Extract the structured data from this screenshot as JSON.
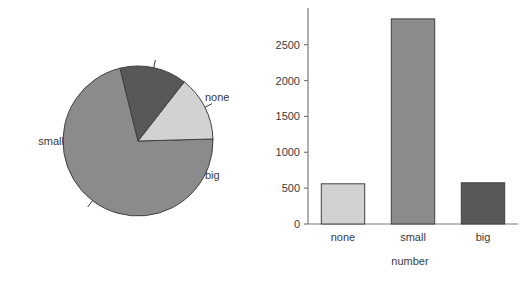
{
  "figure": {
    "width": 521,
    "height": 286,
    "background": "#ffffff"
  },
  "colors": {
    "none": "#d2d2d2",
    "small": "#8b8b8b",
    "big": "#585858",
    "outline": "#404040",
    "axis": "#7a7a7a",
    "text": "#3a3a3a"
  },
  "chart_data": [
    {
      "type": "pie",
      "title": "",
      "labels": [
        "none",
        "small",
        "big"
      ],
      "values": [
        560,
        2860,
        575
      ],
      "percentages": [
        14,
        71.5,
        14.4
      ],
      "colors": [
        "#d2d2d2",
        "#8b8b8b",
        "#585858"
      ],
      "legend": "none",
      "label_positions": [
        "right-upper",
        "left",
        "right-lower"
      ],
      "start_angle_deg": 52,
      "direction": "clockwise",
      "labels_text": {
        "none": "none",
        "small": "small",
        "big": "big"
      }
    },
    {
      "type": "bar",
      "title": "",
      "categories": [
        "none",
        "small",
        "big"
      ],
      "values": [
        560,
        2860,
        575
      ],
      "colors": [
        "#d2d2d2",
        "#8b8b8b",
        "#585858"
      ],
      "xlabel": "number",
      "ylabel": "",
      "ylim": [
        0,
        2900
      ],
      "yticks": [
        0,
        500,
        1000,
        1500,
        2000,
        2500
      ],
      "ytick_labels": [
        "0",
        "500",
        "1000",
        "1500",
        "2000",
        "2500"
      ],
      "grid": false,
      "legend": "none"
    }
  ],
  "pie": {
    "labels": {
      "none": "none",
      "small": "small",
      "big": "big"
    }
  },
  "bar": {
    "yticks": [
      {
        "value": 0,
        "label": "0"
      },
      {
        "value": 500,
        "label": "500"
      },
      {
        "value": 1000,
        "label": "1000"
      },
      {
        "value": 1500,
        "label": "1500"
      },
      {
        "value": 2000,
        "label": "2000"
      },
      {
        "value": 2500,
        "label": "2500"
      }
    ],
    "categories": [
      {
        "label": "none",
        "value": 560
      },
      {
        "label": "small",
        "value": 2860
      },
      {
        "label": "big",
        "value": 575
      }
    ],
    "xlabel": "number"
  }
}
